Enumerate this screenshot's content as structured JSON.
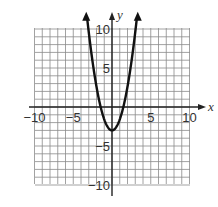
{
  "chart_data": {
    "type": "line",
    "title": "",
    "xlabel": "x",
    "ylabel": "y",
    "xlim": [
      -10,
      10
    ],
    "ylim": [
      -10,
      10
    ],
    "grid": true,
    "grid_step": 1,
    "x_ticks": [
      -10,
      -5,
      5,
      10
    ],
    "y_ticks": [
      10,
      5,
      -5,
      -10
    ],
    "x_tick_labels": [
      "−10",
      "−5",
      "5",
      "10"
    ],
    "y_tick_labels": [
      "10",
      "5",
      "−5",
      "−10"
    ],
    "series": [
      {
        "name": "parabola",
        "equation": "y = a x^2 - 3 (a ≈ 1.4)",
        "vertex": [
          0,
          -3
        ],
        "a": 1.4,
        "k": -3,
        "x": [
          -3.2,
          -3,
          -2,
          -1,
          0,
          1,
          2,
          3,
          3.2
        ],
        "y": [
          11.3,
          9.6,
          2.6,
          -1.6,
          -3,
          -1.6,
          2.6,
          9.6,
          11.3
        ],
        "arrows_both_ends": true,
        "color": "#111111"
      }
    ]
  },
  "labels": {
    "x_axis": "x",
    "y_axis": "y"
  },
  "colors": {
    "grid": "#8a8a8a",
    "axis": "#222222",
    "curve": "#111111",
    "text": "#333333"
  }
}
